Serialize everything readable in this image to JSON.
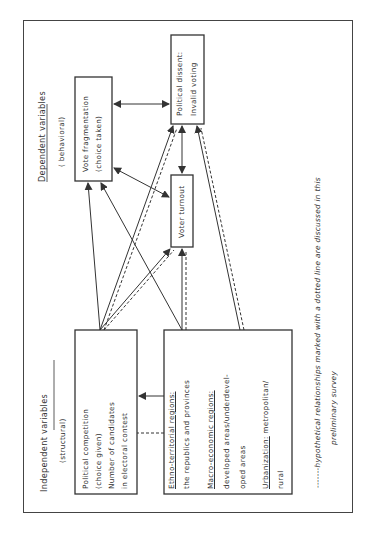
{
  "independent": {
    "title": "Independent variables",
    "subtitle": "(structural)"
  },
  "dependent": {
    "title": "Dependent variables",
    "subtitle": "( behavioral)"
  },
  "boxes": {
    "political_competition": {
      "lines": [
        "Political competition",
        "(choice given)",
        "Number of candidates",
        "in electoral contest"
      ]
    },
    "regions": {
      "ethno_label": "Ethno-territorial regions:",
      "ethno_value": "the republics and provinces",
      "macro_label": "Macro-economic regions:",
      "macro_value_1": "developed areas/underdevel-",
      "macro_value_2": "oped areas",
      "urban_label": "Urbanization:",
      "urban_value_1": " metropolitan/",
      "urban_value_2": "rural"
    },
    "vote_fragmentation": {
      "lines": [
        "Vote fragmentation",
        "(choice taken)"
      ]
    },
    "political_dissent": {
      "lines": [
        "Political dissent:",
        "Invalid voting"
      ]
    },
    "voter_turnout": {
      "label": "Voter turnout"
    }
  },
  "footnote": {
    "line1": "-------hypothetical relationships marked with a dotted line are discussed in this",
    "line2": "preliminary survey"
  },
  "colors": {
    "line": "#333333",
    "frame": "#444444"
  }
}
